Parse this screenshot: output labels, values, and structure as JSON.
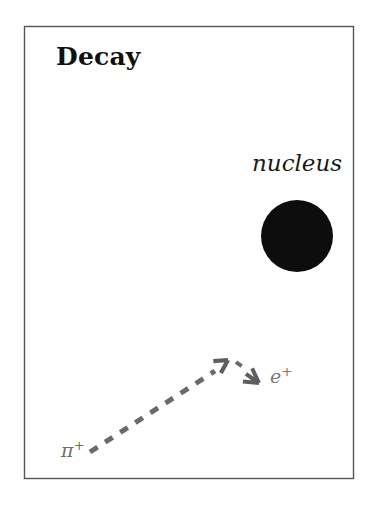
{
  "figure": {
    "title": "Decay",
    "background_color": "#ffffff",
    "frame": {
      "stroke_color": "#555555",
      "stroke_width": 1.4,
      "x": 24,
      "y": 26,
      "width": 329,
      "height": 452
    }
  },
  "labels": {
    "nucleus": "nucleus",
    "pion_symbol": "π",
    "pion_charge": "+",
    "positron_symbol": "e",
    "positron_charge": "+"
  },
  "nucleus_blob": {
    "name": "nucleus",
    "fill_color": "#0d0d0d",
    "center_x": 297,
    "center_y": 236,
    "radius": 36
  },
  "tracks": [
    {
      "name": "pion-track",
      "particle": "π+",
      "style": "dashed",
      "color": "#6a6a6a",
      "stroke_width": 5,
      "dash_pattern": "9 9",
      "x1": 90,
      "y1": 452,
      "x2": 216,
      "y2": 371
    },
    {
      "name": "positron-track",
      "particle": "e+",
      "style": "dashed",
      "color": "#6a6a6a",
      "stroke_width": 4,
      "dash_pattern": "7 7",
      "x1": 236,
      "y1": 362,
      "x2": 248,
      "y2": 371
    }
  ],
  "arrowheads": [
    {
      "name": "pion-arrowhead",
      "direction": "up-right",
      "color": "#5e5e5e",
      "tip_x": 228,
      "tip_y": 360
    },
    {
      "name": "positron-arrowhead",
      "direction": "down-right",
      "color": "#5e5e5e",
      "tip_x": 258,
      "tip_y": 382
    }
  ],
  "colors": {
    "ink": "#111111",
    "nucleus_fill": "#0d0d0d",
    "track_gray": "#6a6a6a",
    "frame_gray": "#555555",
    "background": "#ffffff"
  }
}
